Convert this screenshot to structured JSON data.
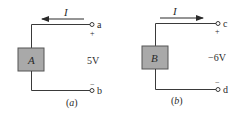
{
  "figure": {
    "panels": [
      {
        "id": "a",
        "caption": "(a)",
        "caption_letter": "a",
        "element_label": "A",
        "current_label": "I",
        "current_direction": "left",
        "top_terminal": "a",
        "bottom_terminal": "b",
        "top_polarity": "+",
        "bottom_polarity": "−",
        "voltage": "5V"
      },
      {
        "id": "b",
        "caption": "(b)",
        "caption_letter": "b",
        "element_label": "B",
        "current_label": "I",
        "current_direction": "right",
        "top_terminal": "c",
        "bottom_terminal": "d",
        "top_polarity": "+",
        "bottom_polarity": "−",
        "voltage": "−6V"
      }
    ],
    "colors": {
      "wire": "#3a3a3a",
      "box_fill": "#a9a9a9",
      "box_stroke": "#555555",
      "text": "#2a2a2a"
    }
  }
}
